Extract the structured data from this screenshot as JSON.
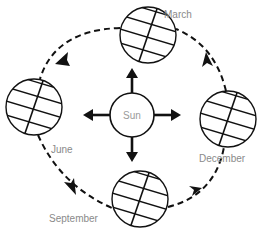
{
  "diagram": {
    "title": "",
    "center": {
      "label": "Sun",
      "icon": "sun-circle"
    },
    "positions": [
      {
        "id": "march",
        "label": "March"
      },
      {
        "id": "june",
        "label": "June"
      },
      {
        "id": "september",
        "label": "September"
      },
      {
        "id": "december",
        "label": "December"
      }
    ],
    "orbit_direction": "counter-clockwise (March → June → September → December → March)",
    "colors": {
      "stroke": "#111111",
      "label": "#8a8a8a",
      "background": "#ffffff"
    }
  }
}
